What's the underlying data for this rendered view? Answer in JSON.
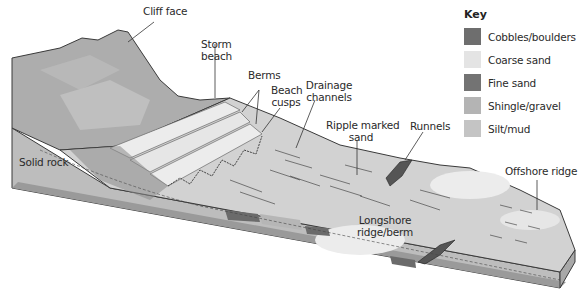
{
  "figure": {
    "type": "block-diagram"
  },
  "labels": {
    "cliff_face": "Cliff face",
    "storm_beach_line1": "Storm",
    "storm_beach_line2": "beach",
    "berms": "Berms",
    "beach_cusps_line1": "Beach",
    "beach_cusps_line2": "cusps",
    "drainage_channels_line1": "Drainage",
    "drainage_channels_line2": "channels",
    "ripple_marked_sand_line1": "Ripple marked",
    "ripple_marked_sand_line2": "sand",
    "runnels": "Runnels",
    "solid_rock": "Solid rock",
    "offshore_ridge": "Offshore ridge",
    "longshore_ridge_line1": "Longshore",
    "longshore_ridge_line2": "ridge/berm"
  },
  "key": {
    "title": "Key",
    "items": [
      {
        "label": "Cobbles/boulders",
        "color": "#6e6e6e"
      },
      {
        "label": "Coarse sand",
        "color": "#e4e4e4"
      },
      {
        "label": "Fine sand",
        "color": "#737373"
      },
      {
        "label": "Shingle/gravel",
        "color": "#b4b4b4"
      },
      {
        "label": "Silt/mud",
        "color": "#c4c4c4"
      }
    ]
  },
  "colors": {
    "outline": "#3a3a3a",
    "rock_side": "#bdbdbd",
    "cliff_top": "#a9a9a9",
    "beach_surface": "#d2d2d2",
    "light_patch": "#ececec",
    "dark_patch": "#6b6b6b"
  }
}
